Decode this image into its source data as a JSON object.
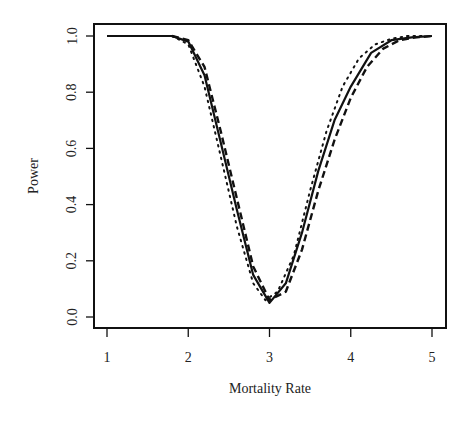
{
  "chart_data": {
    "type": "line",
    "title": "",
    "xlabel": "Mortality Rate",
    "ylabel": "Power",
    "xlim": [
      1,
      5
    ],
    "ylim": [
      0,
      1
    ],
    "x_ticks": [
      "1",
      "2",
      "3",
      "4",
      "5"
    ],
    "y_ticks": [
      "0.0",
      "0.2",
      "0.4",
      "0.6",
      "0.8",
      "1.0"
    ],
    "grid": false,
    "legend": null,
    "series": [
      {
        "name": "solid",
        "style": "solid",
        "x": [
          1.0,
          1.5,
          1.8,
          2.0,
          2.2,
          2.4,
          2.6,
          2.8,
          3.0,
          3.2,
          3.4,
          3.6,
          3.8,
          4.0,
          4.25,
          4.5,
          4.75,
          5.0
        ],
        "y": [
          1.0,
          1.0,
          1.0,
          0.98,
          0.86,
          0.62,
          0.38,
          0.15,
          0.05,
          0.12,
          0.3,
          0.52,
          0.7,
          0.82,
          0.94,
          0.985,
          0.995,
          1.0
        ]
      },
      {
        "name": "dashed",
        "style": "dashed",
        "x": [
          1.8,
          2.0,
          2.2,
          2.4,
          2.6,
          2.8,
          3.0,
          3.2,
          3.4,
          3.6,
          3.8,
          4.0,
          4.2,
          4.4,
          4.6,
          4.8,
          5.0
        ],
        "y": [
          1.0,
          0.985,
          0.89,
          0.66,
          0.42,
          0.18,
          0.06,
          0.09,
          0.24,
          0.45,
          0.63,
          0.78,
          0.89,
          0.955,
          0.985,
          0.995,
          1.0
        ]
      },
      {
        "name": "dotted",
        "style": "dotted",
        "x": [
          1.8,
          2.0,
          2.2,
          2.4,
          2.6,
          2.8,
          2.95,
          3.1,
          3.3,
          3.5,
          3.7,
          3.9,
          4.1,
          4.3,
          4.5,
          4.7,
          4.9
        ],
        "y": [
          1.0,
          0.97,
          0.82,
          0.57,
          0.32,
          0.12,
          0.06,
          0.09,
          0.22,
          0.45,
          0.66,
          0.82,
          0.92,
          0.97,
          0.99,
          1.0,
          1.0
        ]
      }
    ]
  }
}
